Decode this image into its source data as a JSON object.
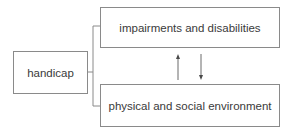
{
  "diagram": {
    "nodes": [
      {
        "id": "handicap",
        "label": "handicap"
      },
      {
        "id": "impairments",
        "label": "impairments and disabilities"
      },
      {
        "id": "environment",
        "label": "physical and social environment"
      }
    ],
    "edges": [
      {
        "from": "handicap",
        "to": "impairments",
        "style": "bracket-line"
      },
      {
        "from": "handicap",
        "to": "environment",
        "style": "bracket-line"
      },
      {
        "from": "environment",
        "to": "impairments",
        "style": "arrow-up"
      },
      {
        "from": "impairments",
        "to": "environment",
        "style": "arrow-down"
      }
    ],
    "colors": {
      "line": "#8a8a8a",
      "text": "#3a3a3a",
      "background": "#ffffff"
    }
  }
}
